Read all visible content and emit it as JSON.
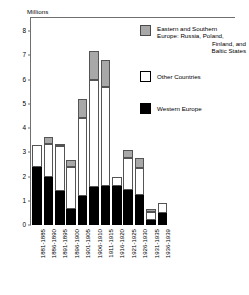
{
  "chart_data": {
    "type": "bar",
    "title": "",
    "subtitle": "",
    "stacked": true,
    "ylabel": "Millions",
    "xlabel": "",
    "ylim": [
      0,
      8.3
    ],
    "yticks": [
      0,
      1,
      2,
      3,
      4,
      5,
      6,
      7,
      8
    ],
    "ytick_labels": [
      "0",
      "1",
      "2",
      "3",
      "4",
      "5",
      "6",
      "7",
      "8"
    ],
    "grid": false,
    "legend_position": "top-right",
    "categories": [
      "1881-1885",
      "1886-1890",
      "1891-1895",
      "1896-1900",
      "1901-1905",
      "1906-1910",
      "1911-1915",
      "1916-1920",
      "1921-1925",
      "1926-1930",
      "1931-1935",
      "1936-1939"
    ],
    "series": [
      {
        "name": "Western Europe",
        "color": "#000000",
        "values": [
          2.4,
          2.0,
          1.4,
          0.65,
          1.2,
          1.55,
          1.6,
          1.6,
          1.45,
          1.25,
          0.2,
          0.5
        ]
      },
      {
        "name": "Other Countries",
        "color": "#ffffff",
        "values": [
          0.9,
          1.35,
          1.85,
          1.75,
          3.2,
          4.45,
          4.1,
          0.4,
          1.3,
          1.1,
          0.35,
          0.4
        ]
      },
      {
        "name": "Eastern and Southern Europe: Russia, Poland, Finland, and Baltic States",
        "color": "#a8a8a8",
        "values": [
          0.0,
          0.3,
          0.1,
          0.3,
          0.8,
          1.2,
          1.1,
          0.0,
          0.35,
          0.4,
          0.1,
          0.0
        ]
      }
    ],
    "totals": [
      3.3,
      3.65,
      3.35,
      2.7,
      5.2,
      7.2,
      6.8,
      2.0,
      3.1,
      2.75,
      0.65,
      0.9
    ]
  },
  "legend": {
    "entries": [
      {
        "key": "east",
        "line1": "Eastern and Southern",
        "line2": "Europe: Russia, Poland,",
        "line3": "Finland, and",
        "line4": "Baltic States"
      },
      {
        "key": "other",
        "line1": "Other Countries",
        "line2": "",
        "line3": "",
        "line4": ""
      },
      {
        "key": "west",
        "line1": "Western Europe",
        "line2": "",
        "line3": "",
        "line4": ""
      }
    ]
  },
  "colors": {
    "eastern_southern_europe": "#a8a8a8",
    "other_countries": "#ffffff",
    "western_europe": "#000000",
    "axis": "#6f6f6f",
    "outline": "#545454",
    "background": "#ffffff"
  }
}
